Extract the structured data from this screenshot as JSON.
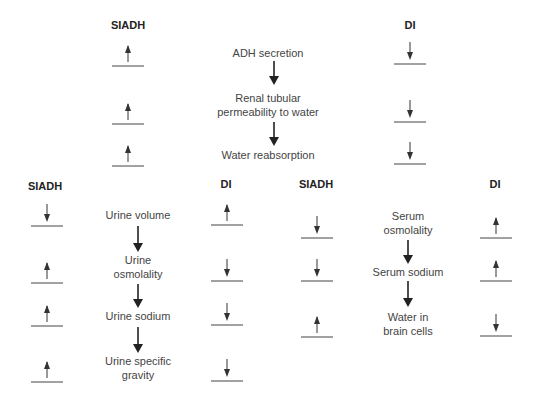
{
  "colors": {
    "text": "#444444",
    "heading": "#222222",
    "arrow": "#222222",
    "line": "#444444"
  },
  "top": {
    "left_header": "SIADH",
    "right_header": "DI",
    "steps": [
      "ADH secretion",
      "Renal tubular\npermeability to water",
      "Water reabsorption"
    ],
    "siadh": [
      "up",
      "up",
      "up"
    ],
    "di": [
      "down",
      "down",
      "down"
    ]
  },
  "bottom_left": {
    "left_header": "SIADH",
    "right_header": "DI",
    "steps": [
      "Urine volume",
      "Urine\nosmolality",
      "Urine sodium",
      "Urine specific\ngravity"
    ],
    "siadh": [
      "down",
      "up",
      "up",
      "up"
    ],
    "di": [
      "up",
      "down",
      "down",
      "down"
    ]
  },
  "bottom_right": {
    "left_header": "SIADH",
    "right_header": "DI",
    "steps": [
      "Serum\nosmolality",
      "Serum sodium",
      "Water in\nbrain cells"
    ],
    "siadh": [
      "down",
      "down",
      "up"
    ],
    "di": [
      "up",
      "up",
      "down"
    ]
  }
}
